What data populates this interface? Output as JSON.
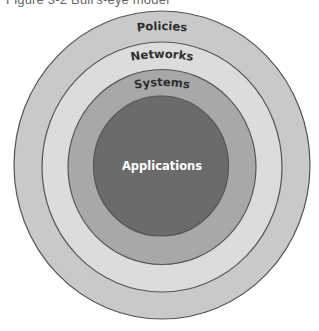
{
  "caption": "Figure 3-2  Bull's-eye model",
  "diagram": {
    "type": "concentric-circles",
    "stroke_color": "#555555",
    "layers": [
      {
        "label": "Policies",
        "fill": "#c9c9c9",
        "label_color": "#2e2e2e"
      },
      {
        "label": "Networks",
        "fill": "#dcdcdc",
        "label_color": "#2e2e2e"
      },
      {
        "label": "Systems",
        "fill": "#a8a8a8",
        "label_color": "#2e2e2e"
      },
      {
        "label": "Applications",
        "fill": "#6b6b6b",
        "label_color": "#ffffff"
      }
    ]
  }
}
